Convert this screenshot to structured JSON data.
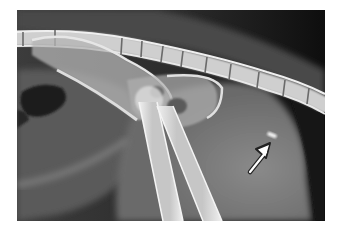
{
  "figure": {
    "type": "radiograph",
    "view": "lateral pelvis",
    "background_color": "#ffffff",
    "image_frame": {
      "x": 17,
      "y": 10,
      "width": 308,
      "height": 211
    },
    "annotation": {
      "type": "arrow",
      "color": "#ffffff",
      "outline": "#222222",
      "direction": "up-right",
      "points_to": "small radiopaque oblong object"
    },
    "colors": {
      "soft_tissue": "#6e6e6e",
      "dark_background": "#121212",
      "bone": "#d8d8d8",
      "gas": "#1e1e1e"
    }
  }
}
